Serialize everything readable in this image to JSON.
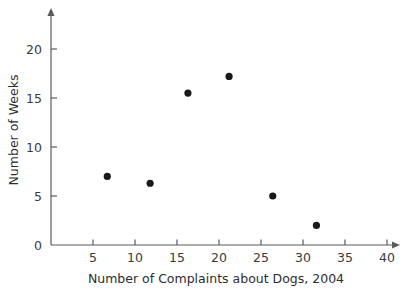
{
  "chart_data": {
    "type": "scatter",
    "title": "",
    "xlabel": "Number of Complaints about Dogs, 2004",
    "ylabel": "Number of Weeks",
    "xlim": [
      0,
      45
    ],
    "ylim": [
      0,
      23
    ],
    "xticks": [
      5,
      10,
      15,
      20,
      25,
      30,
      35,
      40
    ],
    "yticks": [
      0,
      5,
      10,
      15,
      20
    ],
    "xtick_labels": [
      "5",
      "10",
      "15",
      "20",
      "25",
      "30",
      "35",
      "40"
    ],
    "ytick_labels": [
      "0",
      "5",
      "10",
      "15",
      "20"
    ],
    "grid": false,
    "legend": "none",
    "marker": "filled-circle",
    "marker_color": "#1a1a1a",
    "axis_color": "#5b5b5b",
    "points": [
      {
        "x": 6.7,
        "y": 7.0
      },
      {
        "x": 11.8,
        "y": 6.3
      },
      {
        "x": 16.3,
        "y": 15.5
      },
      {
        "x": 21.2,
        "y": 17.2
      },
      {
        "x": 26.4,
        "y": 5.0
      },
      {
        "x": 31.6,
        "y": 2.0
      }
    ]
  }
}
